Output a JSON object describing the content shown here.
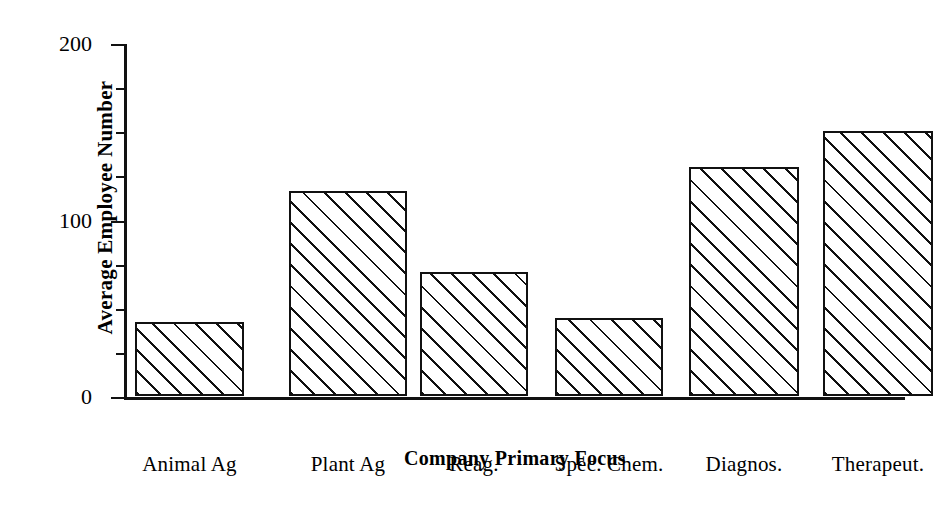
{
  "chart_data": {
    "type": "bar",
    "title": "",
    "xlabel": "Company Primary Focus",
    "ylabel": "Average Employee Number",
    "categories": [
      "Animal Ag",
      "Plant Ag",
      "Reag.",
      "Spec. Chem.",
      "Diagnos.",
      "Therapeut.",
      "Vet."
    ],
    "values": [
      42,
      116,
      70,
      44,
      130,
      150,
      57
    ],
    "ylim": [
      0,
      200
    ],
    "yticks": [
      0,
      100,
      200
    ],
    "ytick_labels": [
      "0",
      "100",
      "200"
    ],
    "yminor_ticks": [
      25,
      50,
      75,
      125,
      150,
      175
    ],
    "grid": false,
    "legend": false,
    "bar_fill": "hatched-diagonal",
    "bar_edge_color": "#111111",
    "background_color": "#ffffff"
  },
  "axis": {
    "y_title": "Average Employee Number",
    "x_title": "Company Primary Focus"
  }
}
